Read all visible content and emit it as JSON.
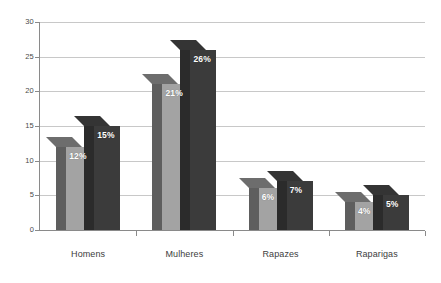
{
  "chart_data": {
    "type": "bar",
    "title": "",
    "subtitle": "",
    "xlabel": "",
    "ylabel": "",
    "categories": [
      "Homens",
      "Mulheres",
      "Rapazes",
      "Raparigas"
    ],
    "series": [
      {
        "name": "serie-1",
        "color": "#a3a3a3",
        "values": [
          12,
          21,
          6,
          4
        ],
        "labels": [
          "12%",
          "21%",
          "6%",
          "4%"
        ]
      },
      {
        "name": "serie-2",
        "color": "#3b3b3b",
        "values": [
          15,
          26,
          7,
          5
        ],
        "labels": [
          "15%",
          "26%",
          "7%",
          "5%"
        ]
      }
    ],
    "ylim": [
      0,
      30
    ],
    "yticks": [
      0,
      5,
      10,
      15,
      20,
      25,
      30
    ],
    "ytick_labels": [
      "0",
      "5",
      "10",
      "15",
      "20",
      "25",
      "30"
    ],
    "grid": true,
    "legend": "none",
    "value_label_color": "#ffffff",
    "background": "#ffffff",
    "gridline_color": "#c8c8c8",
    "axis_color": "#8a8a8a"
  }
}
